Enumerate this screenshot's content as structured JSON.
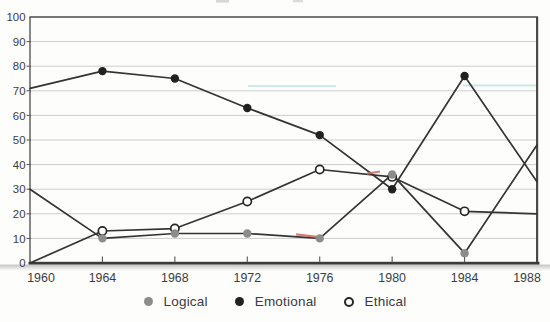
{
  "chart_data": {
    "type": "line",
    "x": [
      1960,
      1964,
      1968,
      1972,
      1976,
      1980,
      1984,
      1988
    ],
    "series": [
      {
        "name": "Logical",
        "marker": "filled-gray",
        "marker_color": "#8c8c8c",
        "values": [
          30,
          10,
          12,
          12,
          10,
          36,
          4,
          48
        ]
      },
      {
        "name": "Emotional",
        "marker": "filled-black",
        "marker_color": "#212121",
        "values": [
          71,
          78,
          75,
          63,
          52,
          30,
          76,
          33
        ]
      },
      {
        "name": "Ethical",
        "marker": "open-circle",
        "marker_color": "#ffffff",
        "values": [
          0,
          13,
          14,
          25,
          38,
          35,
          21,
          20
        ]
      }
    ],
    "title": "",
    "xlabel": "",
    "ylabel": "",
    "ylim": [
      0,
      100
    ],
    "ytick_step": 10,
    "grid": true,
    "legend_position": "bottom-center",
    "markers_at": [
      1964,
      1968,
      1972,
      1976,
      1980,
      1984
    ],
    "first_last_points_at_plot_edges": true
  },
  "axes": {
    "y_labels": [
      "100",
      "90",
      "80",
      "70",
      "60",
      "50",
      "40",
      "30",
      "20",
      "10",
      "0"
    ],
    "x_labels": [
      "1960",
      "1964",
      "1968",
      "1972",
      "1976",
      "1980",
      "1984",
      "1988"
    ]
  },
  "colors": {
    "background": "#fdfdfc",
    "line": "#343434",
    "grid": "#cdcdcd",
    "border": "#4a4a4a",
    "axis": "#3b3b3b",
    "tick": "#555555",
    "axis_text": "#3c3c3e",
    "legend_text": "#3a3a40",
    "marker_logical": "#8c8c8c",
    "marker_emotional": "#212121",
    "marker_ethical_ring": "#262626",
    "scan_artifact_teal": "#a9dcd6",
    "scan_artifact_red": "#cf6a5a"
  }
}
